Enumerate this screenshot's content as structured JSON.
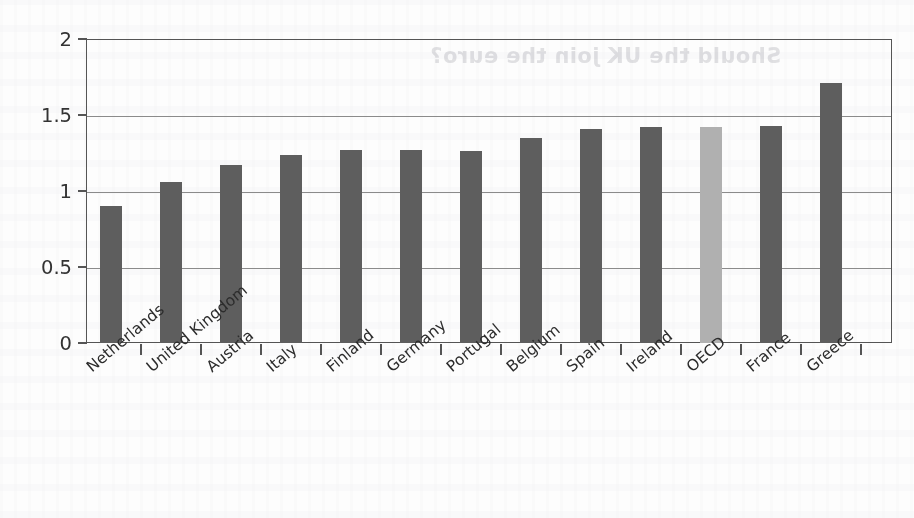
{
  "page": {
    "ghost_title": "Should the UK join the euro?"
  },
  "chart_data": {
    "type": "bar",
    "title": "",
    "subtitle": "",
    "xlabel": "",
    "ylabel": "",
    "ylim": [
      0,
      2
    ],
    "ytick_values": [
      0,
      0.5,
      1,
      1.5,
      2
    ],
    "ytick_labels": [
      "0",
      "0.5",
      "1",
      "1.5",
      "2"
    ],
    "grid": true,
    "gridlines_at": [
      0.5,
      1,
      1.5,
      2
    ],
    "legend": "none",
    "bar_color": "#5e5e5e",
    "highlight_color": "#b0b0b0",
    "highlight_category": "OECD",
    "categories": [
      "Netherlands",
      "United Kingdom",
      "Austria",
      "Italy",
      "Finland",
      "Germany",
      "Portugal",
      "Belgium",
      "Spain",
      "Ireland",
      "OECD",
      "France",
      "Greece"
    ],
    "values": [
      0.9,
      1.06,
      1.17,
      1.24,
      1.27,
      1.27,
      1.26,
      1.35,
      1.41,
      1.42,
      1.42,
      1.43,
      1.71
    ]
  }
}
